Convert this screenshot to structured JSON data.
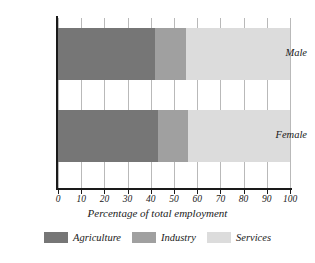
{
  "chart_data": {
    "type": "bar",
    "orientation": "horizontal",
    "stacked": true,
    "title": "",
    "xlabel": "Percentage of total employment",
    "ylabel": "",
    "xlim": [
      0,
      100
    ],
    "xticks": [
      0,
      10,
      20,
      30,
      40,
      50,
      60,
      70,
      80,
      90,
      100
    ],
    "xtick_labels": [
      "0",
      "10",
      "20",
      "30",
      "40",
      "50",
      "60",
      "70",
      "80",
      "90",
      "100"
    ],
    "grid": true,
    "legend_position": "bottom",
    "categories": [
      "Male",
      "Female"
    ],
    "series": [
      {
        "name": "Agriculture",
        "color": "#767676",
        "values": [
          42,
          43
        ]
      },
      {
        "name": "Industry",
        "color": "#a0a0a0",
        "values": [
          13,
          13
        ]
      },
      {
        "name": "Services",
        "color": "#dcdcdc",
        "values": [
          45,
          44
        ]
      }
    ]
  },
  "colors": {
    "agriculture": "#767676",
    "industry": "#a0a0a0",
    "services": "#dcdcdc",
    "axis": "#1a1a1a",
    "grid": "#b9b9b9",
    "background": "#ffffff"
  }
}
